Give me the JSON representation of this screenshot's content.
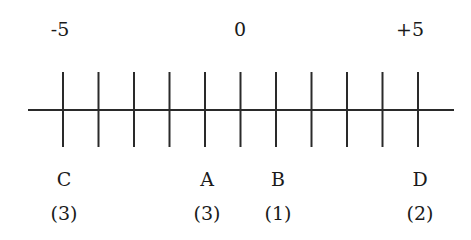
{
  "number_line": {
    "min": -5,
    "max": 5,
    "step": 1,
    "axis_labels": [
      {
        "value": -5,
        "text": "-5"
      },
      {
        "value": 0,
        "text": "0"
      },
      {
        "value": 5,
        "text": "+5"
      }
    ],
    "points": [
      {
        "letter": "C",
        "value": -5,
        "count": "(3)"
      },
      {
        "letter": "A",
        "value": -1,
        "count": "(3)"
      },
      {
        "letter": "B",
        "value": 1,
        "count": "(1)"
      },
      {
        "letter": "D",
        "value": 5,
        "count": "(2)"
      }
    ],
    "line_color": "#2a2a2a"
  }
}
